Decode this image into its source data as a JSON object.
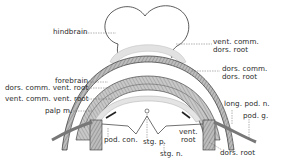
{
  "figure": {
    "type": "anatomical diagram",
    "colors": {
      "ink": "#2a2a2a",
      "band_dark": "#555555",
      "band_mid": "#9a9a9a",
      "band_light": "#d4d4d4",
      "background": "#ffffff"
    }
  },
  "labels": {
    "hindbrain": "hindbrain",
    "forebrain": "forebrain",
    "dors_comm_vent_root": "dors. comm. vent. root",
    "vent_comm_vent_root": "vent. comm. vent. root",
    "palp_m": "palp m.",
    "pod_con": "pod. con.",
    "stg_p": "stg. p.",
    "stg_n": "stg. n.",
    "vent_root_line1": "vent.",
    "vent_root_line2": "root",
    "dors_root_bottom": "dors. root",
    "long_pod_n": "long. pod. n.",
    "pod_g": "pod. g.",
    "vent_comm_dors_root_line1": "vent. comm.",
    "vent_comm_dors_root_line2": "dors. root",
    "dors_comm_dors_root_line1": "dors. comm.",
    "dors_comm_dors_root_line2": "dors. root"
  }
}
